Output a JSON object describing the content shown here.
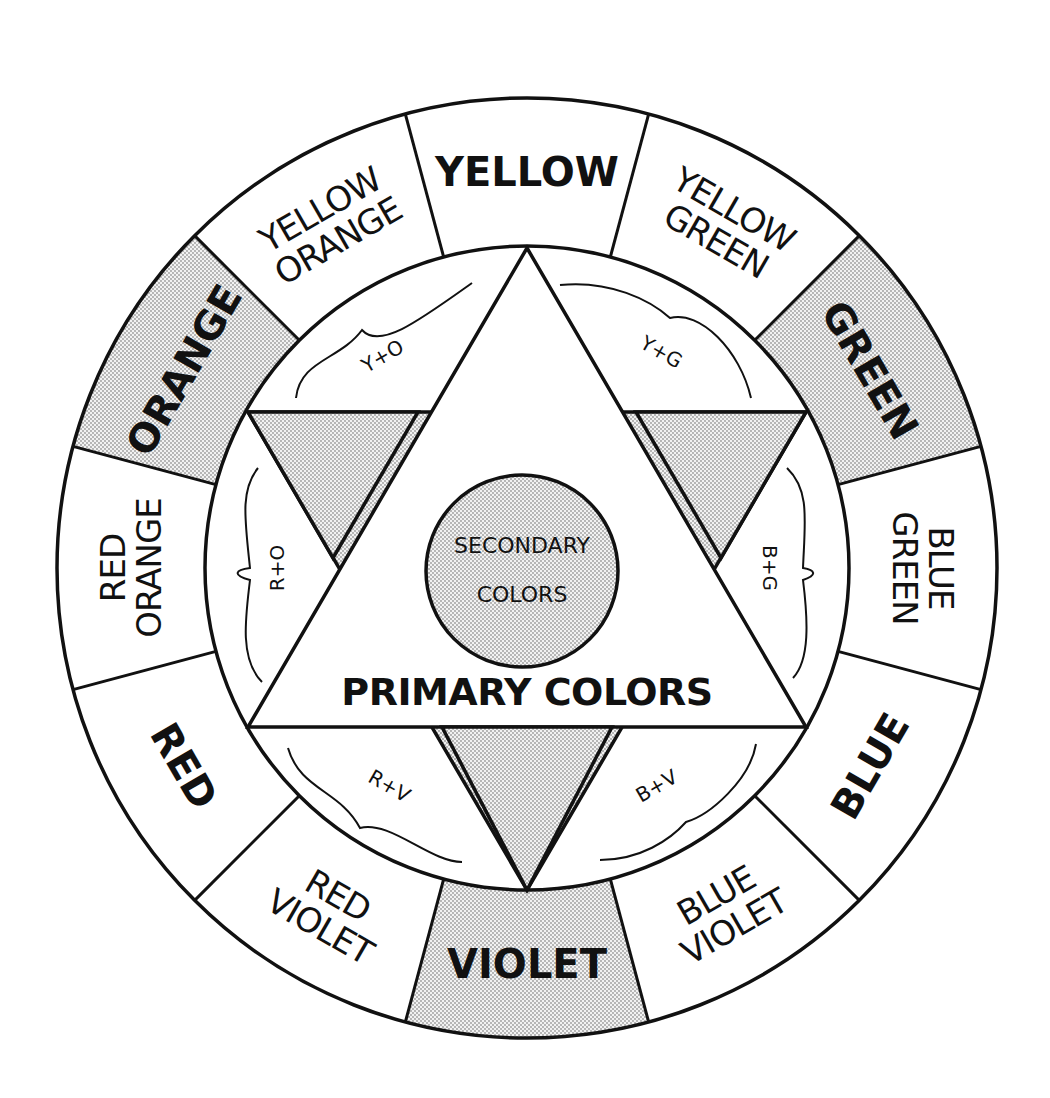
{
  "colors": {
    "ink": "#111111",
    "paper": "#ffffff",
    "shade": "#e6e6e6"
  },
  "wheel": {
    "segments": [
      {
        "name": "YELLOW",
        "lines": [
          "YELLOW"
        ],
        "style": "bold",
        "shaded": false
      },
      {
        "name": "YELLOW GREEN",
        "lines": [
          "YELLOW",
          "GREEN"
        ],
        "style": "light",
        "shaded": false
      },
      {
        "name": "GREEN",
        "lines": [
          "GREEN"
        ],
        "style": "bold",
        "shaded": true
      },
      {
        "name": "BLUE GREEN",
        "lines": [
          "BLUE",
          "GREEN"
        ],
        "style": "light",
        "shaded": false
      },
      {
        "name": "BLUE",
        "lines": [
          "BLUE"
        ],
        "style": "bold",
        "shaded": false
      },
      {
        "name": "BLUE VIOLET",
        "lines": [
          "BLUE",
          "VIOLET"
        ],
        "style": "light",
        "shaded": false
      },
      {
        "name": "VIOLET",
        "lines": [
          "VIOLET"
        ],
        "style": "bold",
        "shaded": true
      },
      {
        "name": "RED VIOLET",
        "lines": [
          "RED",
          "VIOLET"
        ],
        "style": "light",
        "shaded": false
      },
      {
        "name": "RED",
        "lines": [
          "RED"
        ],
        "style": "bold",
        "shaded": false
      },
      {
        "name": "RED ORANGE",
        "lines": [
          "RED",
          "ORANGE"
        ],
        "style": "light",
        "shaded": false
      },
      {
        "name": "ORANGE",
        "lines": [
          "ORANGE"
        ],
        "style": "bold",
        "shaded": true
      },
      {
        "name": "YELLOW ORANGE",
        "lines": [
          "YELLOW",
          "ORANGE"
        ],
        "style": "light",
        "shaded": false
      }
    ]
  },
  "mixes": {
    "y_o": "Y+O",
    "y_g": "Y+G",
    "r_o": "R+O",
    "b_g": "B+G",
    "r_v": "R+V",
    "b_v": "B+V"
  },
  "center": {
    "secondary_line1": "SECONDARY",
    "secondary_line2": "COLORS",
    "primary": "PRIMARY COLORS"
  }
}
